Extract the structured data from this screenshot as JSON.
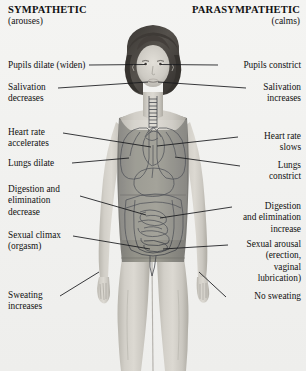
{
  "headers": {
    "left": {
      "title": "SYMPATHETIC",
      "subtitle": "(arouses)"
    },
    "right": {
      "title": "PARASYMPATHETIC",
      "subtitle": "(calms)"
    }
  },
  "left_labels": [
    {
      "id": "pupils-dilate",
      "text": "Pupils dilate (widen)"
    },
    {
      "id": "salivation-decreases",
      "text": "Salivation\ndecreases"
    },
    {
      "id": "heart-rate-accelerates",
      "text": "Heart rate\naccelerates"
    },
    {
      "id": "lungs-dilate",
      "text": "Lungs dilate"
    },
    {
      "id": "digestion-decrease",
      "text": "Digestion and\nelimination\ndecrease"
    },
    {
      "id": "sexual-climax",
      "text": "Sexual climax\n(orgasm)"
    },
    {
      "id": "sweating-increases",
      "text": "Sweating\nincreases"
    }
  ],
  "right_labels": [
    {
      "id": "pupils-constrict",
      "text": "Pupils constrict"
    },
    {
      "id": "salivation-increases",
      "text": "Salivation\nincreases"
    },
    {
      "id": "heart-rate-slows",
      "text": "Heart rate\nslows"
    },
    {
      "id": "lungs-constrict",
      "text": "Lungs\nconstrict"
    },
    {
      "id": "digestion-increase",
      "text": "Digestion\nand elimination\nincrease"
    },
    {
      "id": "sexual-arousal",
      "text": "Sexual arousal\n(erection,\nvaginal\nlubrication)"
    },
    {
      "id": "no-sweating",
      "text": "No sweating"
    }
  ],
  "figure": {
    "organs": [
      "trachea",
      "lungs",
      "heart",
      "stomach",
      "small intestine",
      "large intestine"
    ]
  },
  "colors": {
    "background": "#f2f2f0",
    "leader_line": "#15161a",
    "organ_outline": "#3e4047",
    "text": "#111111",
    "skin": "#c9c6bf",
    "garment": "#8d8c88",
    "hair": "#4a4744"
  }
}
